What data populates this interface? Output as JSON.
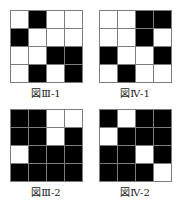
{
  "page": {
    "background_color": "#ffffff",
    "grid_line_color": "#7d7d7d",
    "filled_color": "#000000",
    "empty_color": "#ffffff"
  },
  "figures": [
    {
      "id": "fig-3-1",
      "caption": "図Ⅲ-1",
      "rows": 4,
      "columns": 4,
      "cells": [
        [
          "w",
          "b",
          "w",
          "w"
        ],
        [
          "b",
          "w",
          "w",
          "w"
        ],
        [
          "w",
          "w",
          "b",
          "b"
        ],
        [
          "w",
          "b",
          "w",
          "b"
        ]
      ]
    },
    {
      "id": "fig-4-1",
      "caption": "図Ⅳ-1",
      "rows": 4,
      "columns": 4,
      "cells": [
        [
          "w",
          "w",
          "b",
          "b"
        ],
        [
          "w",
          "w",
          "b",
          "w"
        ],
        [
          "b",
          "w",
          "w",
          "b"
        ],
        [
          "w",
          "b",
          "w",
          "w"
        ]
      ]
    },
    {
      "id": "fig-3-2",
      "caption": "図Ⅲ-2",
      "rows": 4,
      "columns": 4,
      "cells": [
        [
          "b",
          "b",
          "w",
          "w"
        ],
        [
          "b",
          "b",
          "w",
          "b"
        ],
        [
          "w",
          "b",
          "b",
          "b"
        ],
        [
          "b",
          "b",
          "b",
          "b"
        ]
      ]
    },
    {
      "id": "fig-4-2",
      "caption": "図Ⅳ-2",
      "rows": 4,
      "columns": 4,
      "cells": [
        [
          "b",
          "w",
          "b",
          "b"
        ],
        [
          "w",
          "b",
          "b",
          "b"
        ],
        [
          "b",
          "b",
          "w",
          "b"
        ],
        [
          "b",
          "b",
          "b",
          "w"
        ]
      ]
    }
  ]
}
